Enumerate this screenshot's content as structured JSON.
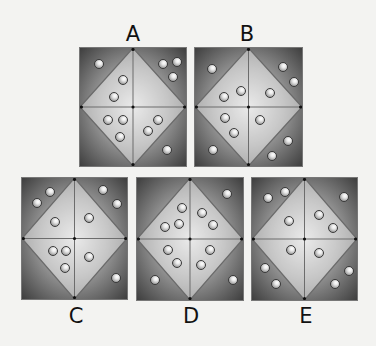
{
  "puzzle": {
    "options": [
      {
        "label": "A",
        "label_pos": [
          133,
          24
        ],
        "box": {
          "x": 79,
          "y": 47,
          "w": 108,
          "h": 120
        },
        "balls": [
          [
            19,
            16
          ],
          [
            83,
            16
          ],
          [
            97,
            14
          ],
          [
            93,
            29
          ],
          [
            43,
            32
          ],
          [
            34,
            49
          ],
          [
            28,
            72
          ],
          [
            43,
            72
          ],
          [
            40,
            89
          ],
          [
            78,
            72
          ],
          [
            68,
            83
          ],
          [
            87,
            102
          ]
        ]
      },
      {
        "label": "B",
        "label_pos": [
          247,
          24
        ],
        "box": {
          "x": 194,
          "y": 47,
          "w": 109,
          "h": 120
        },
        "balls": [
          [
            17,
            21
          ],
          [
            88,
            19
          ],
          [
            99,
            34
          ],
          [
            29,
            49
          ],
          [
            46,
            43
          ],
          [
            75,
            45
          ],
          [
            30,
            70
          ],
          [
            39,
            85
          ],
          [
            65,
            72
          ],
          [
            18,
            102
          ],
          [
            93,
            93
          ],
          [
            77,
            108
          ]
        ]
      },
      {
        "label": "C",
        "label_pos": [
          76,
          306
        ],
        "box": {
          "x": 21,
          "y": 177,
          "w": 107,
          "h": 123
        },
        "balls": [
          [
            28,
            14
          ],
          [
            15,
            25
          ],
          [
            81,
            12
          ],
          [
            95,
            26
          ],
          [
            33,
            44
          ],
          [
            67,
            40
          ],
          [
            31,
            73
          ],
          [
            44,
            73
          ],
          [
            43,
            90
          ],
          [
            67,
            79
          ],
          [
            94,
            100
          ]
        ]
      },
      {
        "label": "D",
        "label_pos": [
          191,
          306
        ],
        "box": {
          "x": 136,
          "y": 177,
          "w": 108,
          "h": 124
        },
        "balls": [
          [
            90,
            16
          ],
          [
            45,
            30
          ],
          [
            28,
            49
          ],
          [
            42,
            46
          ],
          [
            65,
            35
          ],
          [
            76,
            47
          ],
          [
            31,
            72
          ],
          [
            40,
            85
          ],
          [
            73,
            72
          ],
          [
            64,
            87
          ],
          [
            18,
            102
          ],
          [
            96,
            102
          ]
        ]
      },
      {
        "label": "E",
        "label_pos": [
          306,
          306
        ],
        "box": {
          "x": 251,
          "y": 177,
          "w": 107,
          "h": 124
        },
        "balls": [
          [
            16,
            20
          ],
          [
            33,
            14
          ],
          [
            92,
            19
          ],
          [
            37,
            43
          ],
          [
            67,
            37
          ],
          [
            81,
            50
          ],
          [
            39,
            72
          ],
          [
            67,
            75
          ],
          [
            13,
            90
          ],
          [
            24,
            106
          ],
          [
            97,
            93
          ],
          [
            83,
            106
          ]
        ]
      }
    ],
    "colors": {
      "line": "#6a6a6a",
      "dot": "#111111",
      "label": "#111111"
    }
  }
}
